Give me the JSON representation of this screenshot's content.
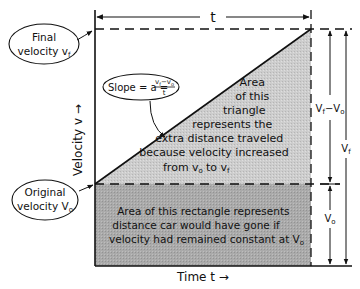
{
  "diagram": {
    "colors": {
      "ink": "#111111",
      "triangle_fill": "#c8c8c8",
      "rectangle_fill": "#a9a9a9",
      "background": "#ffffff"
    },
    "time_dimension": {
      "label": "t"
    },
    "callouts": {
      "final_velocity": {
        "line1": "Final",
        "line2": "velocity v",
        "sub": "f"
      },
      "original_velocity": {
        "line1": "Original",
        "line2": "velocity V",
        "sub": "o"
      },
      "slope": {
        "text": "Slope = a =",
        "numerator": "v",
        "num_sub1": "f",
        "num_minus": "−v",
        "num_sub2": "o",
        "denominator": "t"
      }
    },
    "axes": {
      "y_label": "Velocity v →",
      "x_label": "Time t →"
    },
    "triangle_text": {
      "lines": [
        "Area",
        "of this",
        "triangle",
        "represents the",
        "extra distance traveled",
        "because velocity increased",
        "from  v",
        "to v"
      ],
      "from_sub": "o",
      "to_sub": "f"
    },
    "rectangle_text": {
      "lines": [
        "Area of this rectangle represents",
        "distance car would have gone if",
        "velocity had remained constant at V"
      ],
      "sub": "o"
    },
    "right_dimensions": {
      "delta": {
        "label": "V",
        "sub1": "f",
        "minus": "−V",
        "sub2": "o"
      },
      "total": {
        "label": "V",
        "sub": "f"
      },
      "base": {
        "label": "V",
        "sub": "o"
      }
    }
  }
}
